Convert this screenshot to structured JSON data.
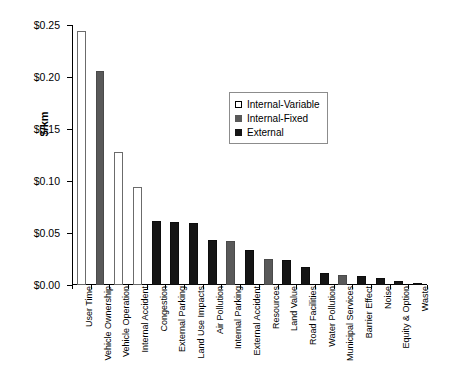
{
  "chart_data": {
    "type": "bar",
    "title": "",
    "xlabel": "",
    "ylabel": "$/km",
    "ylim": [
      0,
      0.25
    ],
    "ytick_labels": [
      "$0.00",
      "$0.05",
      "$0.10",
      "$0.15",
      "$0.20",
      "$0.25"
    ],
    "ytick_values": [
      0.0,
      0.05,
      0.1,
      0.15,
      0.2,
      0.25
    ],
    "grid": false,
    "legend_position": "upper-right",
    "legend": [
      {
        "key": "v",
        "label": "Internal-Variable",
        "color": "#ffffff"
      },
      {
        "key": "f",
        "label": "Internal-Fixed",
        "color": "#595959"
      },
      {
        "key": "e",
        "label": "External",
        "color": "#151515"
      }
    ],
    "categories": [
      "User Time",
      "Vehicle Ownership",
      "Vehicle Operation",
      "Internal Accident",
      "Congestion",
      "External Parking",
      "Land Use Impacts",
      "Air Pollution",
      "Internal Parking",
      "External Accident",
      "Resources",
      "Land Value",
      "Road Facilities",
      "Water Pollution",
      "Municipal Services",
      "Barrier Effect",
      "Noise",
      "Equity & Option",
      "Waste"
    ],
    "values": [
      0.244,
      0.206,
      0.128,
      0.094,
      0.062,
      0.061,
      0.06,
      0.043,
      0.042,
      0.034,
      0.025,
      0.024,
      0.017,
      0.012,
      0.01,
      0.009,
      0.007,
      0.004,
      0.002
    ],
    "groups": [
      "v",
      "f",
      "v",
      "v",
      "e",
      "e",
      "e",
      "e",
      "f",
      "e",
      "f",
      "e",
      "e",
      "e",
      "f",
      "e",
      "e",
      "e",
      "e"
    ]
  }
}
